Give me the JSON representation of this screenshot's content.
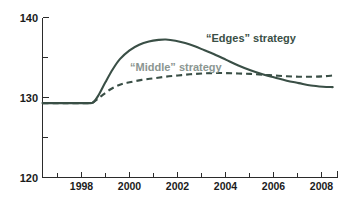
{
  "chart_data": {
    "type": "line",
    "title": "",
    "subtitle": "",
    "xlabel": "",
    "ylabel": "",
    "xlim": [
      1996.4,
      2008.6
    ],
    "ylim": [
      120,
      140
    ],
    "grid": false,
    "legend_position": "inline-annotations",
    "y_ticks_labeled": [
      "140",
      "130",
      "120"
    ],
    "y_tick_values": [
      140,
      135,
      130,
      125,
      120
    ],
    "y_tick_labels_shown": [
      140,
      130,
      120
    ],
    "x_ticks_labeled": [
      "1998",
      "2000",
      "2002",
      "2004",
      "2006",
      "2008"
    ],
    "x_tick_values": [
      1997,
      1998,
      1999,
      2000,
      2001,
      2002,
      2003,
      2004,
      2005,
      2006,
      2007,
      2008
    ],
    "x_tick_labels_shown": [
      1998,
      2000,
      2002,
      2004,
      2006,
      2008
    ],
    "annotations": [
      {
        "text": "“Edges” strategy",
        "series": "edges",
        "x_px": 206,
        "y_px": 38
      },
      {
        "text": "“Middle” strategy",
        "series": "middle",
        "x_px": 130,
        "y_px": 68
      }
    ],
    "series": [
      {
        "name": "“Edges” strategy",
        "style": "solid",
        "color": "#3a4f46",
        "x": [
          1996.4,
          1997.0,
          1997.5,
          1998.0,
          1998.3,
          1998.5,
          1998.7,
          1999.0,
          1999.3,
          1999.6,
          2000.0,
          2000.4,
          2000.8,
          2001.2,
          2001.5,
          2001.9,
          2002.3,
          2002.7,
          2003.1,
          2003.5,
          2004.0,
          2004.5,
          2005.0,
          2005.5,
          2006.0,
          2006.5,
          2007.0,
          2007.5,
          2008.0,
          2008.4
        ],
        "y": [
          129.3,
          129.3,
          129.3,
          129.3,
          129.3,
          129.4,
          130.2,
          131.9,
          133.5,
          134.8,
          135.9,
          136.6,
          137.0,
          137.2,
          137.25,
          137.1,
          136.8,
          136.4,
          135.9,
          135.4,
          134.7,
          134.0,
          133.4,
          132.9,
          132.5,
          132.1,
          131.8,
          131.5,
          131.35,
          131.3
        ]
      },
      {
        "name": "“Middle” strategy",
        "style": "dashed",
        "color": "#3a4f46",
        "x": [
          1996.4,
          1997.0,
          1997.5,
          1998.0,
          1998.3,
          1998.5,
          1998.8,
          1999.2,
          1999.6,
          2000.0,
          2000.5,
          2001.0,
          2001.5,
          2002.0,
          2002.5,
          2003.0,
          2003.5,
          2004.0,
          2004.5,
          2005.0,
          2005.5,
          2006.0,
          2006.5,
          2007.0,
          2007.5,
          2008.0,
          2008.4
        ],
        "y": [
          129.3,
          129.3,
          129.3,
          129.3,
          129.3,
          129.4,
          130.1,
          131.0,
          131.6,
          131.9,
          132.2,
          132.4,
          132.6,
          132.75,
          132.9,
          133.0,
          133.05,
          133.05,
          133.0,
          132.95,
          132.85,
          132.75,
          132.65,
          132.6,
          132.6,
          132.65,
          132.75
        ]
      }
    ]
  },
  "axes": {
    "y_labels": [
      "140",
      "130",
      "120"
    ],
    "x_labels": [
      "1998",
      "2000",
      "2002",
      "2004",
      "2006",
      "2008"
    ]
  },
  "colors": {
    "line": "#3a4f46",
    "axis": "#2b2b2b",
    "label_edges": "#3a4f46",
    "label_middle": "#8b9691",
    "background": "#ffffff"
  }
}
